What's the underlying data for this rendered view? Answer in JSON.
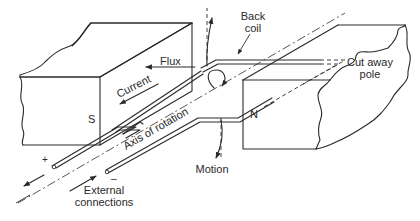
{
  "diagram": {
    "labels": {
      "flux": "Flux",
      "back_coil": "Back",
      "back_coil_2": "coil",
      "current": "Current",
      "cut_away_pole": "Cut away",
      "cut_away_pole_2": "pole",
      "south_pole": "S",
      "north_pole": "N",
      "axis_of_rotation": "Axis of rotation",
      "motion": "Motion",
      "external_connections": "External",
      "external_connections_2": "connections",
      "plus": "+",
      "minus": "–"
    },
    "colors": {
      "line": "#2a2a2a",
      "background": "#ffffff"
    }
  }
}
